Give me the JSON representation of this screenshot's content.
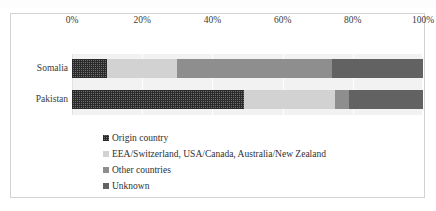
{
  "chart_data": {
    "type": "bar",
    "orientation": "horizontal",
    "stacked": true,
    "normalized": "100%",
    "title": "",
    "subtitle": "",
    "xlabel": "",
    "ylabel": "",
    "xlim": [
      0,
      100
    ],
    "grid": true,
    "axis_position": "top",
    "legend_position": "bottom",
    "categories": [
      "Somalia",
      "Pakistan"
    ],
    "tick_labels": [
      "0%",
      "20%",
      "40%",
      "60%",
      "80%",
      "100%"
    ],
    "tick_values": [
      0,
      20,
      40,
      60,
      80,
      100
    ],
    "series": [
      {
        "name": "Origin country",
        "color": "#6f6f6f",
        "pattern": "checkered",
        "values": [
          10,
          49
        ]
      },
      {
        "name": "EEA/Switzerland, USA/Canada, Australia/New Zealand",
        "color": "#d2d2d2",
        "pattern": "solid",
        "values": [
          20,
          26
        ]
      },
      {
        "name": "Other countries",
        "color": "#8e8e8e",
        "pattern": "solid",
        "values": [
          44,
          4
        ]
      },
      {
        "name": "Unknown",
        "color": "#626262",
        "pattern": "solid",
        "values": [
          26,
          21
        ]
      }
    ]
  },
  "legend": {
    "items": [
      {
        "label": "Origin country"
      },
      {
        "label": "EEA/Switzerland, USA/Canada, Australia/New Zealand"
      },
      {
        "label": "Other countries"
      },
      {
        "label": "Unknown"
      }
    ]
  },
  "colors": {
    "origin_country": "#6f6f6f",
    "eea_usa_canada_australia_nz": "#d2d2d2",
    "other_countries": "#8e8e8e",
    "unknown": "#626262",
    "plot_background": "#f2f2f2",
    "frame_border": "#d2d2d2"
  }
}
